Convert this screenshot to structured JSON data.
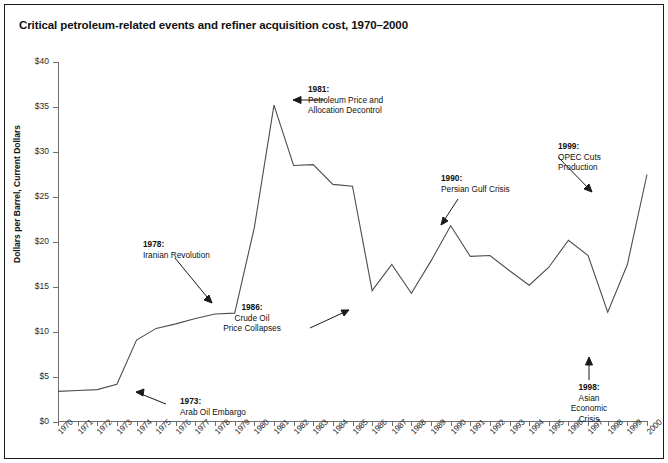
{
  "chart_data": {
    "type": "line",
    "title": "Critical petroleum-related events and refiner acquisition cost, 1970–2000",
    "xlabel": "",
    "ylabel": "Dollars per Barrel, Current Dollars",
    "ylim": [
      0,
      40
    ],
    "ytick_labels": [
      "$0",
      "$5",
      "$10",
      "$15",
      "$20",
      "$25",
      "$30",
      "$35",
      "$40"
    ],
    "ytick_values": [
      0,
      5,
      10,
      15,
      20,
      25,
      30,
      35,
      40
    ],
    "xlim": [
      1970,
      2000
    ],
    "grid": false,
    "legend": "none",
    "line_color": "#4d4d4d",
    "categories": [
      "1970",
      "1971",
      "1972",
      "1973",
      "1974",
      "1975",
      "1976",
      "1977",
      "1978",
      "1979",
      "1980",
      "1981",
      "1982",
      "1983",
      "1984",
      "1985",
      "1986",
      "1987",
      "1988",
      "1989",
      "1990",
      "1991",
      "1992",
      "1993",
      "1994",
      "1995",
      "1996",
      "1997",
      "1998",
      "1999",
      "2000"
    ],
    "values": [
      3.4,
      3.5,
      3.6,
      4.2,
      9.1,
      10.4,
      10.9,
      11.5,
      12.0,
      12.1,
      21.6,
      35.2,
      28.5,
      28.6,
      26.4,
      26.2,
      14.6,
      17.5,
      14.3,
      17.9,
      21.8,
      18.4,
      18.5,
      16.8,
      15.2,
      17.2,
      20.2,
      18.5,
      12.2,
      17.5,
      27.5
    ],
    "annotations": [
      {
        "year": "1973:",
        "text": "Arab Oil Embargo",
        "align": "left"
      },
      {
        "year": "1978:",
        "text": "Iranian Revolution",
        "align": "left"
      },
      {
        "year": "1981:",
        "text": "Petroleum Price and Allocation Decontrol",
        "align": "left"
      },
      {
        "year": "1986:",
        "text": "Crude Oil Price Collapses",
        "align": "center"
      },
      {
        "year": "1990:",
        "text": "Persian Gulf Crisis",
        "align": "left"
      },
      {
        "year": "1999:",
        "text": "OPEC Cuts Production",
        "align": "left"
      },
      {
        "year": "1998:",
        "text": "Asian Economic Crisis",
        "align": "center"
      }
    ]
  },
  "annotations": {
    "a1973": {
      "year": "1973:",
      "l1": "Arab Oil Embargo"
    },
    "a1978": {
      "year": "1978:",
      "l1": "Iranian Revolution"
    },
    "a1981": {
      "year": "1981:",
      "l1": "Petroleum Price and",
      "l2": "Allocation Decontrol"
    },
    "a1986": {
      "year": "1986:",
      "l1": "Crude Oil",
      "l2": "Price Collapses"
    },
    "a1990": {
      "year": "1990:",
      "l1": "Persian Gulf Crisis"
    },
    "a1999": {
      "year": "1999:",
      "l1": "OPEC Cuts",
      "l2": "Production"
    },
    "a1998": {
      "year": "1998:",
      "l1": "Asian",
      "l2": "Economic",
      "l3": "Crisis"
    }
  }
}
